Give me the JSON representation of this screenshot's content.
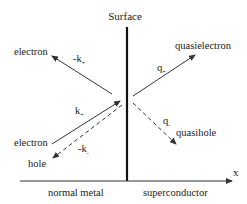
{
  "diagram": {
    "title": "Surface",
    "axis_label": "x",
    "regions": {
      "left": "normal metal",
      "right": "superconductor"
    },
    "particles": {
      "reflected_electron": {
        "label": "electron",
        "wavevector": "-k",
        "sub": "+"
      },
      "incident_electron": {
        "label": "electron",
        "wavevector": "k",
        "sub": "+"
      },
      "reflected_hole": {
        "label": "hole",
        "wavevector": "-k",
        "sub": "-"
      },
      "transmitted_quasielectron": {
        "label": "quasielectron",
        "wavevector": "q",
        "sub": "+"
      },
      "transmitted_quasihole": {
        "label": "quasihole",
        "wavevector": "q",
        "sub": "-"
      }
    },
    "colors": {
      "line": "#222222",
      "surface": "#111111"
    }
  }
}
